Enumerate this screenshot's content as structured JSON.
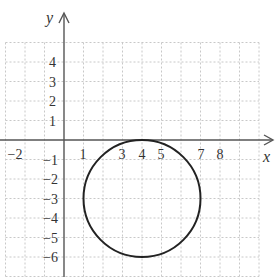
{
  "chart_data": {
    "type": "diagram",
    "title": "",
    "xlabel": "x",
    "ylabel": "y",
    "xlim": [
      -3,
      10
    ],
    "ylim": [
      -7,
      5
    ],
    "grid": true,
    "x_tick_labels": [
      "-2",
      "1",
      "3",
      "4",
      "5",
      "7",
      "8"
    ],
    "x_tick_values": [
      -2,
      1,
      3,
      4,
      5,
      7,
      8
    ],
    "y_tick_labels": [
      "4",
      "3",
      "2",
      "1",
      "-1",
      "-2",
      "-3",
      "-4",
      "-5",
      "-6"
    ],
    "y_tick_values": [
      4,
      3,
      2,
      1,
      -1,
      -2,
      -3,
      -4,
      -5,
      -6
    ],
    "shapes": [
      {
        "shape": "circle",
        "center": [
          4,
          -3
        ],
        "radius": 3
      }
    ]
  },
  "colors": {
    "axis": "#555555",
    "grid": "#c8c8c8",
    "circle": "#222222",
    "label": "#333333"
  },
  "labels": {
    "x_axis": "x",
    "y_axis": "y",
    "x_ticks": [
      "−2",
      "1",
      "3",
      "4",
      "5",
      "7",
      "8"
    ],
    "y_ticks": [
      "4",
      "3",
      "2",
      "1",
      "−1",
      "−2",
      "−3",
      "−4",
      "−5",
      "−6"
    ]
  }
}
